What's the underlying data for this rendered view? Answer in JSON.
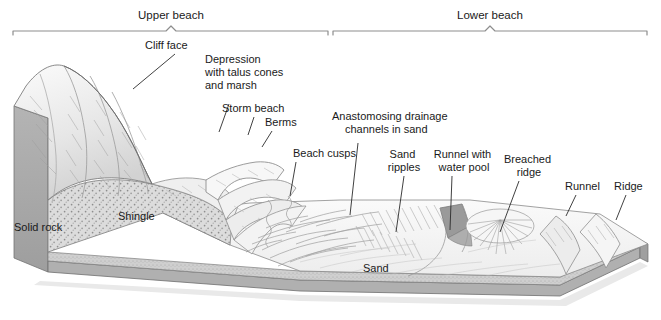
{
  "figure": {
    "background_color": "#ffffff",
    "label_color": "#1a1a1a",
    "bracket_color": "#8d8d8d",
    "leader_color": "#2b2b2b"
  },
  "brackets": [
    {
      "id": "upper-beach",
      "label": "Upper beach",
      "x_start": 13,
      "x_end": 330,
      "tick_y": 32,
      "label_x": 171,
      "label_y": 15
    },
    {
      "id": "lower-beach",
      "label": "Lower beach",
      "x_start": 333,
      "x_end": 648,
      "tick_y": 32,
      "label_x": 490,
      "label_y": 15
    }
  ],
  "labels": [
    {
      "id": "cliff-face",
      "lines": [
        "Cliff face"
      ],
      "x": 145,
      "y": 49,
      "anchor": "start",
      "leader": [
        [
          175,
          54
        ],
        [
          133,
          89
        ]
      ]
    },
    {
      "id": "depression",
      "lines": [
        "Depression",
        "with talus cones",
        "and marsh"
      ],
      "x": 205,
      "y": 63,
      "anchor": "start",
      "leader": [
        [
          229,
          104
        ],
        [
          219,
          132
        ]
      ]
    },
    {
      "id": "storm-beach",
      "lines": [
        "Storm beach"
      ],
      "x": 222,
      "y": 112,
      "anchor": "start",
      "leader": [
        [
          254,
          117
        ],
        [
          248,
          135
        ]
      ]
    },
    {
      "id": "berms",
      "lines": [
        "Berms"
      ],
      "x": 265,
      "y": 126,
      "anchor": "start",
      "leader": [
        [
          272,
          131
        ],
        [
          262,
          147
        ]
      ]
    },
    {
      "id": "anastomosing",
      "lines": [
        "Anastomosing drainage",
        "channels in sand"
      ],
      "x": 332,
      "y": 120,
      "anchor": "start",
      "leader": [
        [
          358,
          143
        ],
        [
          350,
          215
        ]
      ]
    },
    {
      "id": "beach-cusps",
      "lines": [
        "Beach cusps"
      ],
      "x": 293,
      "y": 157,
      "anchor": "start",
      "leader": [
        [
          296,
          162
        ],
        [
          290,
          196
        ]
      ]
    },
    {
      "id": "sand-ripples",
      "lines": [
        "Sand",
        "ripples"
      ],
      "x": 404,
      "y": 158,
      "anchor": "middle",
      "leader": [
        [
          404,
          176
        ],
        [
          396,
          232
        ]
      ]
    },
    {
      "id": "runnel-water-pool",
      "lines": [
        "Runnel with",
        "water pool"
      ],
      "x": 464,
      "y": 158,
      "anchor": "middle",
      "leader": [
        [
          452,
          176
        ],
        [
          450,
          230
        ]
      ]
    },
    {
      "id": "breached-ridge",
      "lines": [
        "Breached",
        "ridge"
      ],
      "x": 529,
      "y": 163,
      "anchor": "middle",
      "leader": [
        [
          519,
          181
        ],
        [
          500,
          232
        ]
      ]
    },
    {
      "id": "runnel",
      "lines": [
        "Runnel"
      ],
      "x": 565,
      "y": 190,
      "anchor": "start",
      "leader": [
        [
          576,
          195
        ],
        [
          566,
          216
        ]
      ]
    },
    {
      "id": "ridge",
      "lines": [
        "Ridge"
      ],
      "x": 614,
      "y": 190,
      "anchor": "start",
      "leader": [
        [
          626,
          195
        ],
        [
          616,
          220
        ]
      ]
    },
    {
      "id": "solid-rock",
      "lines": [
        "Solid rock"
      ],
      "x": 14,
      "y": 231,
      "anchor": "start",
      "leader": null
    },
    {
      "id": "shingle",
      "lines": [
        "Shingle"
      ],
      "x": 118,
      "y": 220,
      "anchor": "start",
      "leader": null
    },
    {
      "id": "sand",
      "lines": [
        "Sand"
      ],
      "x": 363,
      "y": 272,
      "anchor": "start",
      "leader": null
    }
  ],
  "terrain": {
    "rock_face_color": "#a9a9a9",
    "rock_top_color": "#c9c9c9",
    "shingle_color": "#d9d9d9",
    "sand_color": "#f2f2f2",
    "sand_band_color": "#c7c7c7",
    "water_pool_color": "#9a9a9a",
    "shadow_color": "#e8e8e8",
    "outline_color": "#6f6f6f"
  }
}
